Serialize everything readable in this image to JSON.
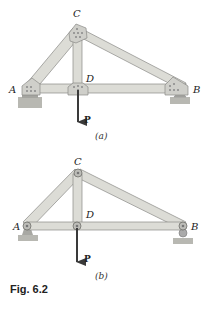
{
  "figure": {
    "caption": "Fig. 6.2",
    "colors": {
      "member_fill": "#dcdcd6",
      "member_stroke": "#8a8a86",
      "plate": "#cfcfca",
      "ground": "#b8b8b2",
      "arrow": "#3a3a3a"
    },
    "panels": [
      {
        "id": "a",
        "sublabel": "(a)",
        "description": "Gusset-plate truss with bolted joints",
        "joints": {
          "A": "A",
          "B": "B",
          "C": "C",
          "D": "D"
        },
        "load_label": "P"
      },
      {
        "id": "b",
        "sublabel": "(b)",
        "description": "Idealized pin-connected truss",
        "joints": {
          "A": "A",
          "B": "B",
          "C": "C",
          "D": "D"
        },
        "load_label": "P"
      }
    ]
  }
}
